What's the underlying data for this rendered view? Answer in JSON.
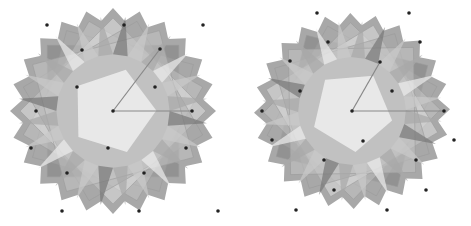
{
  "colors": {
    "background": "#ffffff",
    "tile_dark": "#777777",
    "tile_mid": "#a8a8a8",
    "tile_light": "#c9c9c9",
    "tile_pale": "#ececec",
    "dot": "#222222",
    "line": "#888888"
  },
  "diagrams": [
    {
      "name": "left-rosette",
      "center": [
        113,
        111
      ],
      "radius": 103,
      "rotation": 0,
      "lines": [
        {
          "from": [
            113,
            111
          ],
          "to": [
            160,
            49
          ]
        },
        {
          "from": [
            113,
            111
          ],
          "to": [
            192,
            111
          ]
        }
      ],
      "dots": [
        [
          47,
          25
        ],
        [
          124,
          25
        ],
        [
          203,
          25
        ],
        [
          82,
          50
        ],
        [
          160,
          49
        ],
        [
          77,
          87
        ],
        [
          155,
          87
        ],
        [
          36,
          111
        ],
        [
          113,
          111
        ],
        [
          192,
          111
        ],
        [
          31,
          148
        ],
        [
          108,
          148
        ],
        [
          186,
          148
        ],
        [
          67,
          173
        ],
        [
          144,
          173
        ],
        [
          62,
          211
        ],
        [
          139,
          211
        ],
        [
          218,
          211
        ]
      ]
    },
    {
      "name": "right-rosette",
      "center": [
        117,
        111
      ],
      "radius": 98,
      "rotation": 14,
      "lines": [
        {
          "from": [
            117,
            111
          ],
          "to": [
            145,
            62
          ]
        },
        {
          "from": [
            117,
            111
          ],
          "to": [
            209,
            111
          ]
        }
      ],
      "dots": [
        [
          82,
          13
        ],
        [
          174,
          13
        ],
        [
          93,
          42
        ],
        [
          185,
          42
        ],
        [
          55,
          61
        ],
        [
          145,
          62
        ],
        [
          65,
          91
        ],
        [
          157,
          91
        ],
        [
          27,
          111
        ],
        [
          117,
          111
        ],
        [
          209,
          111
        ],
        [
          37,
          140
        ],
        [
          128,
          141
        ],
        [
          219,
          140
        ],
        [
          89,
          160
        ],
        [
          181,
          160
        ],
        [
          99,
          190
        ],
        [
          191,
          190
        ],
        [
          61,
          210
        ],
        [
          152,
          210
        ]
      ]
    }
  ]
}
